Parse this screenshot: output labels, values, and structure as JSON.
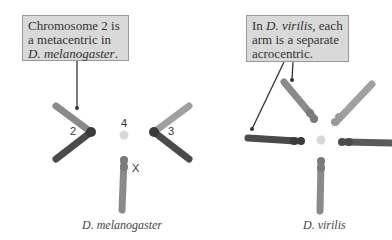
{
  "left_panel": {
    "callout": {
      "line1": "Chromosome 2 is",
      "line2": "a metacentric in",
      "line3_italic": "D. melanogaster",
      "line3_tail": "."
    },
    "labels": {
      "chr2": "2",
      "chr3": "3",
      "chr4": "4",
      "chrX": "X"
    },
    "caption": "D. melanogaster"
  },
  "right_panel": {
    "callout": {
      "line1_pre": "In ",
      "line1_italic": "D. virilis",
      "line1_post": ", each",
      "line2": "arm is a separate",
      "line3": "acrocentric."
    },
    "caption": "D. virilis"
  },
  "colors": {
    "dark_arm": "#4a4a4a",
    "mid_arm": "#8a8a8a",
    "light_arm": "#a8a8a8",
    "dot_4": "#d8d8d8",
    "callout_bg": "#d9d9d9"
  }
}
